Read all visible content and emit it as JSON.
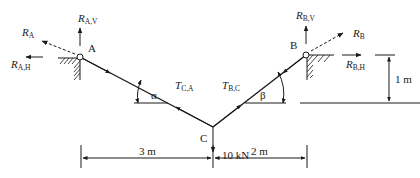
{
  "diagram": {
    "points": {
      "A": {
        "label": "A"
      },
      "B": {
        "label": "B"
      },
      "C": {
        "label": "C"
      }
    },
    "reactions": {
      "RA": {
        "main": "R",
        "sub": "A"
      },
      "RAV": {
        "main": "R",
        "sub": "A,V"
      },
      "RAH": {
        "main": "R",
        "sub": "A,H"
      },
      "RB": {
        "main": "R",
        "sub": "B"
      },
      "RBV": {
        "main": "R",
        "sub": "B,V"
      },
      "RBH": {
        "main": "R",
        "sub": "B,H"
      }
    },
    "tensions": {
      "TCA": {
        "main": "T",
        "sub": "C,A"
      },
      "TBC": {
        "main": "T",
        "sub": "B,C"
      }
    },
    "angles": {
      "alpha": "α",
      "beta": "β"
    },
    "load": "10 kN",
    "dimensions": {
      "left_span": "3 m",
      "right_span": "2 m",
      "height_diff": "1 m"
    }
  }
}
